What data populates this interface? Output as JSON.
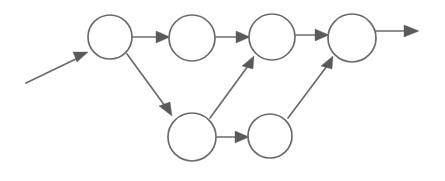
{
  "diagram": {
    "type": "node-link-diagram",
    "canvas": {
      "width": 445,
      "height": 181,
      "background": "#ffffff"
    },
    "style": {
      "node_fill": "#ffffff",
      "node_stroke": "#6b6b6b",
      "edge_stroke": "#6b6b6b",
      "arrowhead_fill": "#5a5a5a",
      "stroke_width": 1.7
    },
    "nodes": [
      {
        "id": "n1",
        "label": "",
        "cx": 110,
        "cy": 37,
        "r": 22
      },
      {
        "id": "n2",
        "label": "",
        "cx": 192,
        "cy": 38,
        "r": 23
      },
      {
        "id": "n3",
        "label": "",
        "cx": 272,
        "cy": 37,
        "r": 23
      },
      {
        "id": "n4",
        "label": "",
        "cx": 352,
        "cy": 38,
        "r": 24
      },
      {
        "id": "n5",
        "label": "",
        "cx": 192,
        "cy": 137,
        "r": 24
      },
      {
        "id": "n6",
        "label": "",
        "cx": 270,
        "cy": 136,
        "r": 22
      }
    ],
    "edges": [
      {
        "id": "e-in",
        "from": "source",
        "to": "n1",
        "label": "",
        "kind": "entry"
      },
      {
        "id": "e-n1-n2",
        "from": "n1",
        "to": "n2",
        "label": "",
        "kind": "horizontal"
      },
      {
        "id": "e-n2-n3",
        "from": "n2",
        "to": "n3",
        "label": "",
        "kind": "horizontal"
      },
      {
        "id": "e-n3-n4",
        "from": "n3",
        "to": "n4",
        "label": "",
        "kind": "horizontal"
      },
      {
        "id": "e-n1-n5",
        "from": "n1",
        "to": "n5",
        "label": "",
        "kind": "diagonal-down"
      },
      {
        "id": "e-n5-n3",
        "from": "n5",
        "to": "n3",
        "label": "",
        "kind": "diagonal-up"
      },
      {
        "id": "e-n5-n6",
        "from": "n5",
        "to": "n6",
        "label": "",
        "kind": "horizontal"
      },
      {
        "id": "e-n6-n4",
        "from": "n6",
        "to": "n4",
        "label": "",
        "kind": "diagonal-up"
      },
      {
        "id": "e-out",
        "from": "n4",
        "to": "sink",
        "label": "",
        "kind": "exit"
      }
    ]
  }
}
